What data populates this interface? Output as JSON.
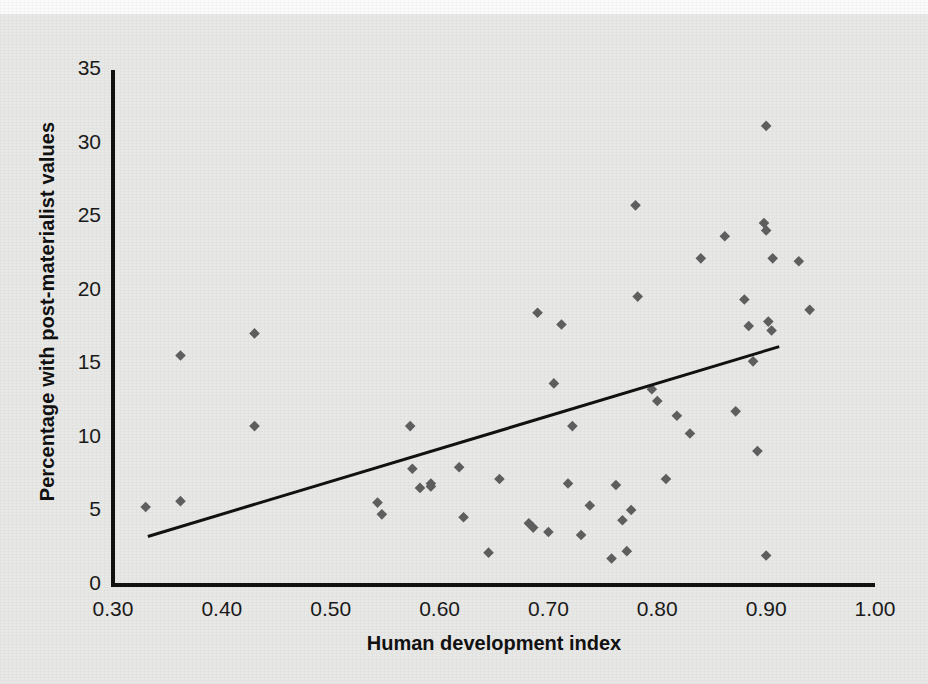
{
  "chart_data": {
    "type": "scatter",
    "title": "",
    "xlabel": "Human development index",
    "ylabel": "Percentage with post-materialist values",
    "xlim": [
      0.3,
      1.0
    ],
    "ylim": [
      0,
      35
    ],
    "grid": false,
    "legend": "none",
    "xticks": [
      "0.30",
      "0.40",
      "0.50",
      "0.60",
      "0.70",
      "0.80",
      "0.90",
      "1.00"
    ],
    "xtick_values": [
      0.3,
      0.4,
      0.5,
      0.6,
      0.7,
      0.8,
      0.9,
      1.0
    ],
    "yticks": [
      "0",
      "5",
      "10",
      "15",
      "20",
      "25",
      "30",
      "35"
    ],
    "ytick_values": [
      0,
      5,
      10,
      15,
      20,
      25,
      30,
      35
    ],
    "marker": "diamond",
    "marker_color": "#5e5e5e",
    "marker_size": 9,
    "points": [
      {
        "x": 0.33,
        "y": 5.3
      },
      {
        "x": 0.362,
        "y": 5.7
      },
      {
        "x": 0.362,
        "y": 15.6
      },
      {
        "x": 0.43,
        "y": 17.1
      },
      {
        "x": 0.43,
        "y": 10.8
      },
      {
        "x": 0.543,
        "y": 5.6
      },
      {
        "x": 0.547,
        "y": 4.8
      },
      {
        "x": 0.573,
        "y": 10.8
      },
      {
        "x": 0.575,
        "y": 7.9
      },
      {
        "x": 0.582,
        "y": 6.6
      },
      {
        "x": 0.592,
        "y": 6.7
      },
      {
        "x": 0.592,
        "y": 6.9
      },
      {
        "x": 0.618,
        "y": 8.0
      },
      {
        "x": 0.622,
        "y": 4.6
      },
      {
        "x": 0.645,
        "y": 2.2
      },
      {
        "x": 0.655,
        "y": 7.2
      },
      {
        "x": 0.682,
        "y": 4.2
      },
      {
        "x": 0.686,
        "y": 3.9
      },
      {
        "x": 0.69,
        "y": 18.5
      },
      {
        "x": 0.7,
        "y": 3.6
      },
      {
        "x": 0.705,
        "y": 13.7
      },
      {
        "x": 0.712,
        "y": 17.7
      },
      {
        "x": 0.718,
        "y": 6.9
      },
      {
        "x": 0.722,
        "y": 10.8
      },
      {
        "x": 0.73,
        "y": 3.4
      },
      {
        "x": 0.738,
        "y": 5.4
      },
      {
        "x": 0.758,
        "y": 1.8
      },
      {
        "x": 0.762,
        "y": 6.8
      },
      {
        "x": 0.768,
        "y": 4.4
      },
      {
        "x": 0.772,
        "y": 2.3
      },
      {
        "x": 0.776,
        "y": 5.1
      },
      {
        "x": 0.78,
        "y": 25.8
      },
      {
        "x": 0.782,
        "y": 19.6
      },
      {
        "x": 0.795,
        "y": 13.3
      },
      {
        "x": 0.8,
        "y": 12.5
      },
      {
        "x": 0.808,
        "y": 7.2
      },
      {
        "x": 0.818,
        "y": 11.5
      },
      {
        "x": 0.83,
        "y": 10.3
      },
      {
        "x": 0.84,
        "y": 22.2
      },
      {
        "x": 0.862,
        "y": 23.7
      },
      {
        "x": 0.872,
        "y": 11.8
      },
      {
        "x": 0.88,
        "y": 19.4
      },
      {
        "x": 0.884,
        "y": 17.6
      },
      {
        "x": 0.888,
        "y": 15.2
      },
      {
        "x": 0.892,
        "y": 9.1
      },
      {
        "x": 0.898,
        "y": 24.6
      },
      {
        "x": 0.9,
        "y": 24.1
      },
      {
        "x": 0.9,
        "y": 31.2
      },
      {
        "x": 0.902,
        "y": 17.9
      },
      {
        "x": 0.905,
        "y": 17.3
      },
      {
        "x": 0.906,
        "y": 22.2
      },
      {
        "x": 0.9,
        "y": 2.0
      },
      {
        "x": 0.93,
        "y": 22.0
      },
      {
        "x": 0.94,
        "y": 18.7
      }
    ],
    "trendline": {
      "color": "#111111",
      "width": 3,
      "x0": 0.332,
      "y0": 3.3,
      "x1": 0.912,
      "y1": 16.2
    }
  },
  "axes": {
    "axis_color": "#111111",
    "background": "#e8e8e6"
  }
}
